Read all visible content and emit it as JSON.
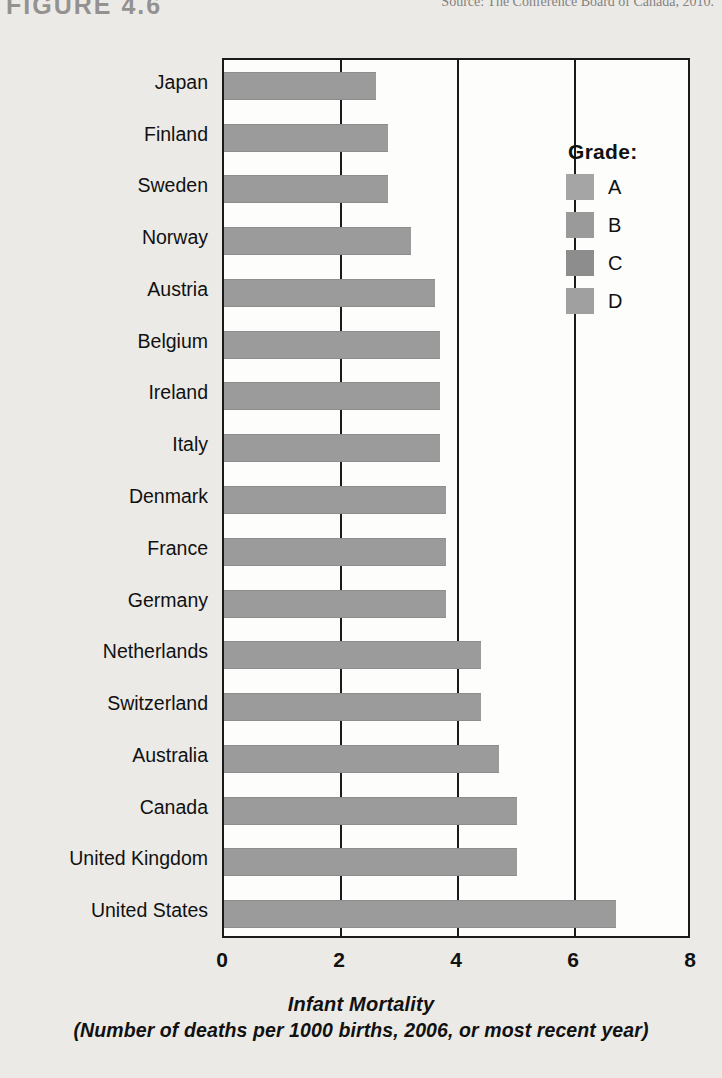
{
  "figure": {
    "label": "FIGURE 4.6",
    "source": "Source: The Conference Board of Canada, 2010."
  },
  "legend": {
    "title": "Grade:",
    "items": [
      {
        "label": "A",
        "color": "#a5a5a5"
      },
      {
        "label": "B",
        "color": "#9a9a9a"
      },
      {
        "label": "C",
        "color": "#8d8d8d"
      },
      {
        "label": "D",
        "color": "#a0a0a0"
      }
    ]
  },
  "axis": {
    "title_line1": "Infant Mortality",
    "title_line2": "(Number of deaths per 1000 births, 2006, or most recent year)",
    "ticks": [
      "0",
      "2",
      "4",
      "6",
      "8"
    ]
  },
  "chart_data": {
    "type": "bar",
    "orientation": "horizontal",
    "title": "Infant Mortality",
    "subtitle": "(Number of deaths per 1000 births, 2006, or most recent year)",
    "xlabel": "Infant Mortality",
    "ylabel": "",
    "xlim": [
      0,
      8
    ],
    "xticks": [
      0,
      2,
      4,
      6,
      8
    ],
    "grid": true,
    "legend_position": "right",
    "bar_color": "#9b9b9b",
    "categories": [
      "Japan",
      "Finland",
      "Sweden",
      "Norway",
      "Austria",
      "Belgium",
      "Ireland",
      "Italy",
      "Denmark",
      "France",
      "Germany",
      "Netherlands",
      "Switzerland",
      "Australia",
      "Canada",
      "United Kingdom",
      "United States"
    ],
    "values": [
      2.6,
      2.8,
      2.8,
      3.2,
      3.6,
      3.7,
      3.7,
      3.7,
      3.8,
      3.8,
      3.8,
      4.4,
      4.4,
      4.7,
      5.0,
      5.0,
      6.7
    ],
    "grades": [
      "A",
      "A",
      "A",
      "A",
      "A",
      "B",
      "B",
      "B",
      "B",
      "B",
      "B",
      "C",
      "C",
      "C",
      "C",
      "C",
      "D"
    ],
    "series": [
      {
        "name": "Infant mortality rate",
        "values": [
          2.6,
          2.8,
          2.8,
          3.2,
          3.6,
          3.7,
          3.7,
          3.7,
          3.8,
          3.8,
          3.8,
          4.4,
          4.4,
          4.7,
          5.0,
          5.0,
          6.7
        ]
      }
    ]
  }
}
